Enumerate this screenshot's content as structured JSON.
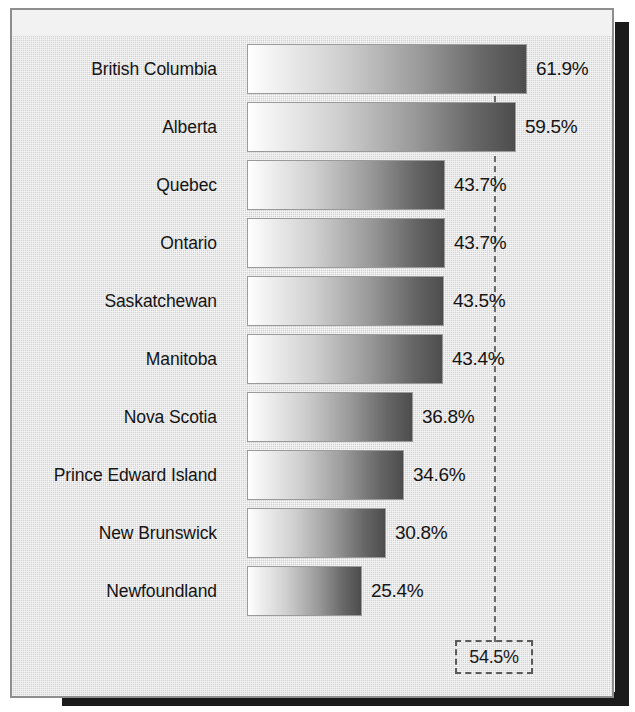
{
  "chart_data": {
    "type": "bar",
    "orientation": "horizontal",
    "title": "",
    "subtitle": "",
    "xlabel": "",
    "ylabel": "",
    "categories": [
      "British Columbia",
      "Alberta",
      "Quebec",
      "Ontario",
      "Saskatchewan",
      "Manitoba",
      "Nova Scotia",
      "Prince Edward Island",
      "New Brunswick",
      "Newfoundland"
    ],
    "values": [
      61.9,
      59.5,
      43.7,
      43.7,
      43.5,
      43.4,
      36.8,
      34.6,
      30.8,
      25.4
    ],
    "value_labels": [
      "61.9%",
      "59.5%",
      "43.7%",
      "43.7%",
      "43.5%",
      "43.4%",
      "36.8%",
      "34.6%",
      "30.8%",
      "25.4%"
    ],
    "xlim": [
      0,
      61.9
    ],
    "grid": false,
    "legend": null,
    "annotations": [
      {
        "name": "reference-line",
        "label": "54.5%",
        "value": 54.5,
        "style": "dashed vertical line with dashed boxed label at bottom"
      }
    ],
    "bar_style": {
      "fill": "linear gradient white to dark gray, left to right",
      "gradient_start_color": "#ffffff",
      "gradient_end_color": "#4d4d4d",
      "border_color": "#9a9a9a"
    },
    "colors": {
      "background": "#d9d9d9",
      "frame_border": "#8e8e8e",
      "text": "#141414",
      "reference_dash": "#6b6b6b",
      "shadow": "#1b1b1b"
    }
  },
  "reference": {
    "value_label": "54.5%"
  }
}
